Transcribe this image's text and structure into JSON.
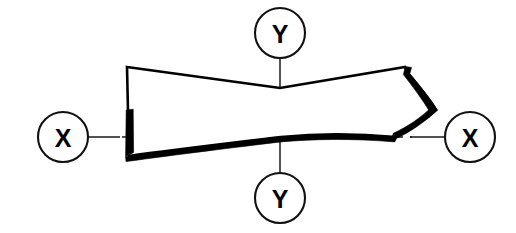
{
  "diagram": {
    "background_color": "#ffffff",
    "line_color": "#000000",
    "markers": [
      {
        "id": "y-top",
        "label": "Y",
        "cx": 280,
        "cy": 33,
        "r": 25,
        "name": "axis-marker-y-top"
      },
      {
        "id": "y-bottom",
        "label": "Y",
        "cx": 280,
        "cy": 198,
        "r": 25,
        "name": "axis-marker-y-bottom"
      },
      {
        "id": "x-left",
        "label": "X",
        "cx": 63,
        "cy": 137,
        "r": 25,
        "name": "axis-marker-x-left"
      },
      {
        "id": "x-right",
        "label": "X",
        "cx": 470,
        "cy": 137,
        "r": 25,
        "name": "axis-marker-x-right"
      }
    ],
    "axes": {
      "x_axis": {
        "label": "X",
        "y": 137,
        "x_start": 88,
        "x_end": 445
      },
      "y_axis": {
        "label": "Y",
        "x": 280,
        "y_start": 58,
        "y_end": 173
      }
    },
    "section": {
      "name": "beam-cross-section",
      "left_edge_x": 127,
      "right_tip_x": 436,
      "top_left_y": 67,
      "top_center_y": 88,
      "bottom_left_y": 156,
      "bottom_center_y": 137
    }
  }
}
